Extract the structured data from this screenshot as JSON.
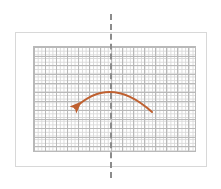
{
  "figure": {
    "title": "",
    "caption": ""
  },
  "canvas": {
    "width": 221,
    "height": 189,
    "background_color": "#ffffff"
  },
  "card": {
    "label": "card-frame",
    "x": 15,
    "y": 32,
    "width": 192,
    "height": 135,
    "fill_color": "#ffffff",
    "border_color": "#d8d8d8"
  },
  "grid": {
    "label": "graph-grid",
    "x": 33,
    "y": 46,
    "width": 163,
    "height": 106,
    "minor_cell_px": 3.7,
    "major_cell_px": 11,
    "minor_line_color": "#d9d9d9",
    "major_line_color": "#b9b9b9",
    "columns_minor": 44,
    "rows_minor": 29
  },
  "symmetry_axis": {
    "label": "axis-of-symmetry",
    "orientation": "vertical",
    "x": 110,
    "y_start": 14,
    "y_end": 178,
    "style": "dashed",
    "color": "#8c8c8c",
    "thickness": 2
  },
  "arrow": {
    "label": "reflection-arrow",
    "color": "#bf6030",
    "direction": "right-to-left",
    "thickness": 2,
    "start": {
      "x": 152,
      "y": 112
    },
    "control": {
      "x": 110,
      "y": 78
    },
    "end": {
      "x": 73,
      "y": 109
    },
    "head_at": {
      "x": 73,
      "y": 109
    },
    "head_size": 9
  }
}
